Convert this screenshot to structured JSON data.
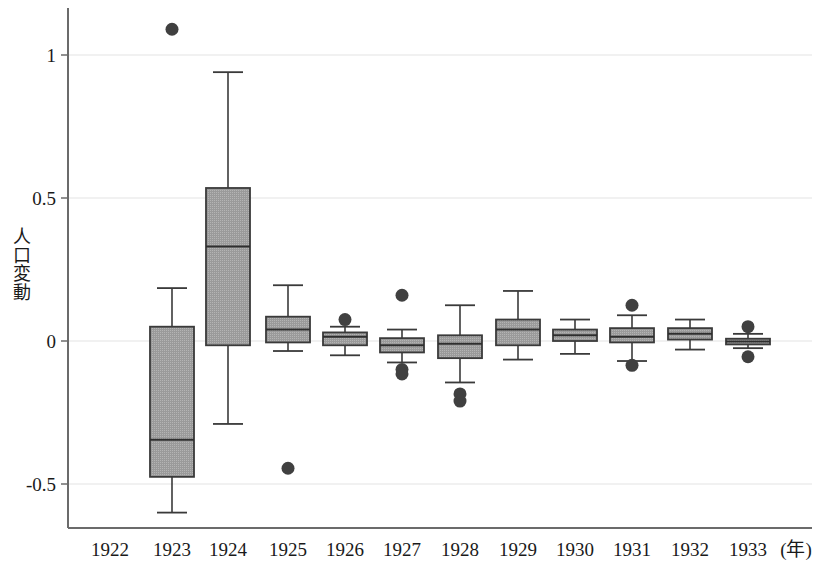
{
  "chart_data": {
    "type": "box",
    "title": "",
    "xlabel": "",
    "ylabel": "人口変動",
    "x_unit_label": "(年)",
    "ylim": [
      -0.72,
      1.17
    ],
    "yticks": [
      1,
      0.5,
      0,
      -0.5
    ],
    "ytick_labels": [
      "1",
      "0.5",
      "0",
      "-0.5"
    ],
    "grid": true,
    "grid_axis": "y",
    "legend": "none",
    "categories": [
      "1922",
      "1923",
      "1924",
      "1925",
      "1926",
      "1927",
      "1928",
      "1929",
      "1930",
      "1931",
      "1932",
      "1933"
    ],
    "box_fill": "#9a9a9a",
    "box_edge": "#3a3a3a",
    "outlier_color": "#404040",
    "boxes": [
      {
        "category": "1922",
        "present": false,
        "whisker_low": null,
        "q1": null,
        "median": null,
        "q3": null,
        "whisker_high": null,
        "outliers": []
      },
      {
        "category": "1923",
        "present": true,
        "whisker_low": -0.6,
        "q1": -0.475,
        "median": -0.345,
        "q3": 0.05,
        "whisker_high": 0.185,
        "outliers": [
          1.09
        ]
      },
      {
        "category": "1924",
        "present": true,
        "whisker_low": -0.29,
        "q1": -0.015,
        "median": 0.33,
        "q3": 0.535,
        "whisker_high": 0.94,
        "outliers": []
      },
      {
        "category": "1925",
        "present": true,
        "whisker_low": -0.035,
        "q1": -0.005,
        "median": 0.04,
        "q3": 0.085,
        "whisker_high": 0.195,
        "outliers": [
          -0.445
        ]
      },
      {
        "category": "1926",
        "present": true,
        "whisker_low": -0.05,
        "q1": -0.015,
        "median": 0.015,
        "q3": 0.03,
        "whisker_high": 0.05,
        "outliers": [
          0.075
        ]
      },
      {
        "category": "1927",
        "present": true,
        "whisker_low": -0.075,
        "q1": -0.04,
        "median": -0.015,
        "q3": 0.01,
        "whisker_high": 0.04,
        "outliers": [
          0.16,
          -0.1,
          -0.115
        ]
      },
      {
        "category": "1928",
        "present": true,
        "whisker_low": -0.145,
        "q1": -0.06,
        "median": -0.01,
        "q3": 0.02,
        "whisker_high": 0.125,
        "outliers": [
          -0.185,
          -0.21
        ]
      },
      {
        "category": "1929",
        "present": true,
        "whisker_low": -0.065,
        "q1": -0.015,
        "median": 0.04,
        "q3": 0.075,
        "whisker_high": 0.175,
        "outliers": []
      },
      {
        "category": "1930",
        "present": true,
        "whisker_low": -0.045,
        "q1": 0.0,
        "median": 0.02,
        "q3": 0.04,
        "whisker_high": 0.075,
        "outliers": []
      },
      {
        "category": "1931",
        "present": true,
        "whisker_low": -0.07,
        "q1": -0.005,
        "median": 0.015,
        "q3": 0.045,
        "whisker_high": 0.09,
        "outliers": [
          0.125,
          -0.085
        ]
      },
      {
        "category": "1932",
        "present": true,
        "whisker_low": -0.03,
        "q1": 0.005,
        "median": 0.025,
        "q3": 0.045,
        "whisker_high": 0.075,
        "outliers": []
      },
      {
        "category": "1933",
        "present": true,
        "whisker_low": -0.025,
        "q1": -0.012,
        "median": -0.002,
        "q3": 0.008,
        "whisker_high": 0.025,
        "outliers": [
          0.05,
          -0.055
        ]
      }
    ]
  },
  "axis": {
    "y_label_chars": [
      "人",
      "口",
      "変",
      "動"
    ]
  }
}
